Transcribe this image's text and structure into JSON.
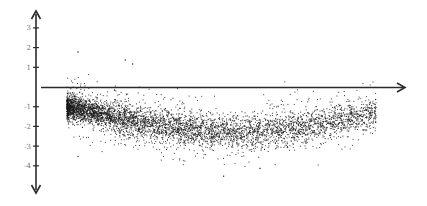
{
  "chart_data": {
    "type": "scatter",
    "title": "",
    "xlabel": "",
    "ylabel": "",
    "ylim": [
      -4.5,
      3.5
    ],
    "y_ticks": [
      3,
      2,
      1,
      -1,
      -2,
      -3,
      -4
    ],
    "y_tick_labels": [
      "3",
      "2",
      "1",
      "-1",
      "-2",
      "-3",
      "-4"
    ],
    "x_ticks": [],
    "grid": false,
    "legend": null,
    "axes": {
      "y_axis": "vertical double-headed arrow at left",
      "x_axis": "horizontal arrow at y = 0 pointing right"
    },
    "series": [
      {
        "name": "points",
        "color": "#1a1a1a",
        "approx_count": 5000,
        "description": "Dense band starting near y=-1 at the left, curving down to about y=-2.3 in the middle, rising to about y=-1.5 at the right; density decreases to the right",
        "trend_centerline": [
          {
            "x": 0.08,
            "y": -1.0
          },
          {
            "x": 0.15,
            "y": -1.3
          },
          {
            "x": 0.25,
            "y": -1.7
          },
          {
            "x": 0.35,
            "y": -2.0
          },
          {
            "x": 0.45,
            "y": -2.25
          },
          {
            "x": 0.55,
            "y": -2.3
          },
          {
            "x": 0.65,
            "y": -2.15
          },
          {
            "x": 0.75,
            "y": -1.9
          },
          {
            "x": 0.85,
            "y": -1.55
          },
          {
            "x": 0.9,
            "y": -1.4
          }
        ],
        "spread_sd": 0.45,
        "outliers": [
          {
            "x": 0.1,
            "y": 1.8
          },
          {
            "x": 0.23,
            "y": 1.4
          },
          {
            "x": 0.25,
            "y": 1.2
          },
          {
            "x": 0.1,
            "y": -3.5
          },
          {
            "x": 0.5,
            "y": -4.5
          },
          {
            "x": 0.6,
            "y": -4.1
          }
        ]
      }
    ]
  },
  "colors": {
    "axis": "#2b2b2b",
    "points": "#1a1a1a",
    "tick_label": "#777777",
    "background": "#ffffff"
  },
  "layout": {
    "axis_x_px": 36,
    "zero_y_px": 87,
    "px_per_unit": 19.7,
    "plot_left_px": 41,
    "plot_right_px": 405,
    "y_arrow_top_px": 12,
    "y_arrow_bottom_px": 192
  }
}
